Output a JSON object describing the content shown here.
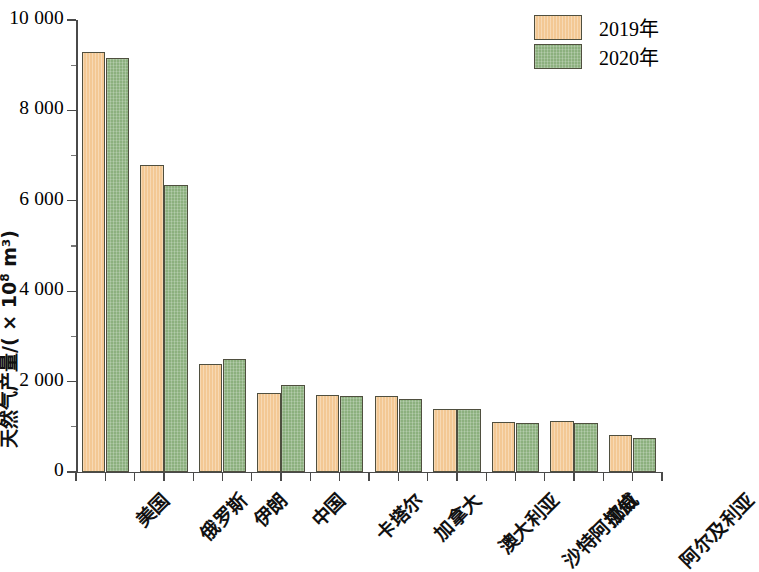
{
  "chart_data": {
    "type": "bar",
    "title": "",
    "subtitle": "",
    "xlabel": "",
    "ylabel": "天然气产量/( × 10⁸ m³)",
    "ylabel_prefix": "天然气产量/( × 10",
    "ylabel_exponent": "8",
    "ylabel_suffix": " m³)",
    "ylim": [
      0,
      10000
    ],
    "ytick_values": [
      0,
      2000,
      4000,
      6000,
      8000,
      10000
    ],
    "ytick_labels": [
      "0",
      "2 000",
      "4 000",
      "6 000",
      "8 000",
      "10 000"
    ],
    "yminor_values": [
      1000,
      3000,
      5000,
      7000,
      9000
    ],
    "grid": false,
    "legend_position": "top-right",
    "categories": [
      "美国",
      "俄罗斯",
      "伊朗",
      "中国",
      "卡塔尔",
      "加拿大",
      "澳大利亚",
      "沙特阿拉伯",
      "挪威",
      "阿尔及利亚"
    ],
    "series": [
      {
        "name": "2019年",
        "color": "#f3c894",
        "values": [
          9300,
          6790,
          2400,
          1750,
          1710,
          1680,
          1400,
          1100,
          1120,
          820
        ]
      },
      {
        "name": "2020年",
        "color": "#8cb07e",
        "values": [
          9150,
          6350,
          2500,
          1920,
          1690,
          1620,
          1390,
          1090,
          1080,
          750
        ]
      }
    ]
  },
  "legend": {
    "items": [
      {
        "label": "2019年",
        "color": "#f3c894"
      },
      {
        "label": "2020年",
        "color": "#8cb07e"
      }
    ]
  },
  "colors": {
    "series_2019": "#f3c894",
    "series_2020": "#8cb07e",
    "bar_border": "#4f4f3f",
    "axis": "#4a4a4a",
    "text": "#111111",
    "background": "#ffffff"
  }
}
